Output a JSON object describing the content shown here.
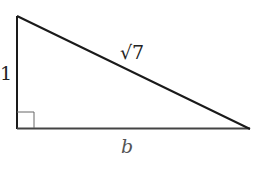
{
  "diagram": {
    "type": "right-triangle",
    "labels": {
      "vertical_leg": "1",
      "hypotenuse": "√7",
      "horizontal_leg": "b"
    },
    "right_angle_marker": true,
    "colors": {
      "line": "#1a1a1a",
      "marker": "#555555",
      "background": "#ffffff"
    }
  }
}
